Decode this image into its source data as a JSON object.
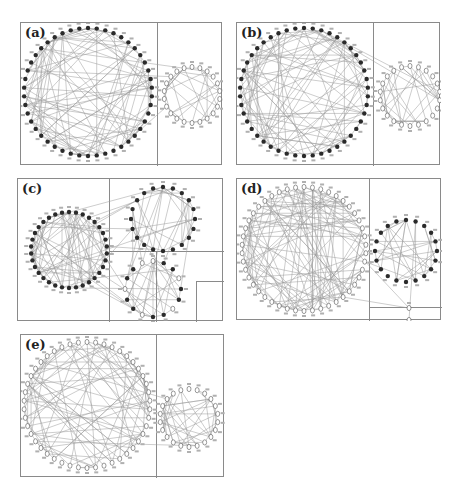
{
  "figure": {
    "width": 459,
    "height": 494,
    "edge_color": "#9a9a9a",
    "border_color": "#8a8a8a",
    "filled_node_color": "#2a2a2a",
    "open_node_color": "#ffffff"
  },
  "panels": [
    {
      "id": "a",
      "label": "(a)",
      "box": {
        "x": 20,
        "y": 22,
        "w": 202,
        "h": 143
      },
      "dividers": [
        {
          "type": "v",
          "pos": 136
        }
      ],
      "communities": [
        {
          "cx": 67,
          "cy": 69,
          "r": 64,
          "nodes": 46,
          "style": "filled",
          "edges": 110
        },
        {
          "cx": 171,
          "cy": 72,
          "r": 28,
          "nodes": 22,
          "style": "open",
          "edges": 40
        }
      ],
      "cross_edges": 4
    },
    {
      "id": "b",
      "label": "(b)",
      "box": {
        "x": 236,
        "y": 22,
        "w": 204,
        "h": 143
      },
      "dividers": [
        {
          "type": "v",
          "pos": 136
        }
      ],
      "communities": [
        {
          "cx": 67,
          "cy": 69,
          "r": 64,
          "nodes": 46,
          "style": "filled",
          "edges": 110
        },
        {
          "cx": 173,
          "cy": 73,
          "r": 30,
          "nodes": 22,
          "style": "open",
          "edges": 40
        }
      ],
      "cross_edges": 3
    },
    {
      "id": "c",
      "label": "(c)",
      "box": {
        "x": 17,
        "y": 178,
        "w": 206,
        "h": 143
      },
      "dividers": [
        {
          "type": "v",
          "pos": 91
        },
        {
          "type": "h",
          "pos": 72,
          "from": 91,
          "to": 206
        },
        {
          "type": "v",
          "pos": 138,
          "from": 72,
          "to": 143
        },
        {
          "type": "h",
          "pos": 102,
          "from": 178,
          "to": 206
        },
        {
          "type": "v",
          "pos": 178,
          "from": 102,
          "to": 143
        }
      ],
      "communities": [
        {
          "cx": 51,
          "cy": 71,
          "r": 38,
          "nodes": 34,
          "style": "filled",
          "edges": 80
        },
        {
          "cx": 145,
          "cy": 40,
          "r": 32,
          "nodes": 20,
          "style": "filled",
          "edges": 35
        },
        {
          "cx": 135,
          "cy": 110,
          "r": 28,
          "nodes": 16,
          "style": "filled-mixed",
          "edges": 30
        }
      ],
      "cross_edges": 30
    },
    {
      "id": "d",
      "label": "(d)",
      "box": {
        "x": 236,
        "y": 178,
        "w": 205,
        "h": 142
      },
      "dividers": [
        {
          "type": "v",
          "pos": 132
        },
        {
          "type": "h",
          "pos": 128,
          "from": 132,
          "to": 205
        }
      ],
      "communities": [
        {
          "cx": 67,
          "cy": 70,
          "r": 62,
          "nodes": 46,
          "style": "open",
          "edges": 120
        },
        {
          "cx": 169,
          "cy": 72,
          "r": 31,
          "nodes": 20,
          "style": "filled",
          "edges": 38
        },
        {
          "cx": 172,
          "cy": 135,
          "r": 6,
          "nodes": 2,
          "style": "open",
          "edges": 0
        }
      ],
      "cross_edges": 8
    },
    {
      "id": "e",
      "label": "(e)",
      "box": {
        "x": 20,
        "y": 334,
        "w": 204,
        "h": 143
      },
      "dividers": [
        {
          "type": "v",
          "pos": 135
        }
      ],
      "communities": [
        {
          "cx": 66,
          "cy": 70,
          "r": 63,
          "nodes": 46,
          "style": "open",
          "edges": 110
        },
        {
          "cx": 168,
          "cy": 83,
          "r": 29,
          "nodes": 22,
          "style": "open",
          "edges": 40
        }
      ],
      "cross_edges": 3
    }
  ]
}
